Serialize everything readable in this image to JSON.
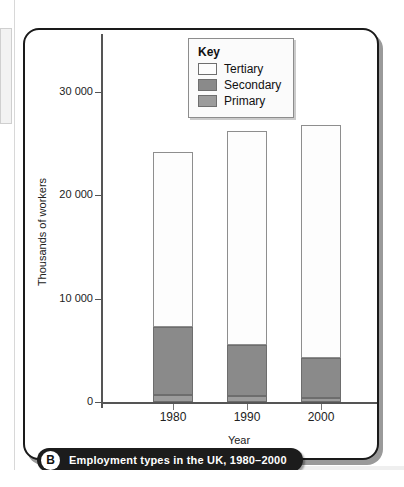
{
  "figure": {
    "badge": "B",
    "caption": "Employment types in the UK, 1980–2000"
  },
  "legend": {
    "title": "Key",
    "entries": [
      {
        "label": "Tertiary",
        "color": "#fdfdfd"
      },
      {
        "label": "Secondary",
        "color": "#8a8a8a"
      },
      {
        "label": "Primary",
        "color": "#9c9c9c"
      }
    ]
  },
  "axes": {
    "y_title": "Thousands of workers",
    "x_title": "Year",
    "y_ticks": [
      "30 000",
      "20 000",
      "10 000",
      "0"
    ],
    "x_ticks": [
      "1980",
      "1990",
      "2000"
    ]
  },
  "chart_data": {
    "type": "bar",
    "stacked": true,
    "title": "Employment types in the UK, 1980–2000",
    "xlabel": "Year",
    "ylabel": "Thousands of workers",
    "categories": [
      "1980",
      "1990",
      "2000"
    ],
    "series": [
      {
        "name": "Primary",
        "color": "#9c9c9c",
        "values": [
          700,
          600,
          400
        ]
      },
      {
        "name": "Secondary",
        "color": "#8a8a8a",
        "values": [
          6600,
          4900,
          3900
        ]
      },
      {
        "name": "Tertiary",
        "color": "#fdfdfd",
        "values": [
          16900,
          20700,
          22500
        ]
      }
    ],
    "totals": [
      24200,
      26200,
      26800
    ],
    "ylim": [
      0,
      32000
    ],
    "ytick_values": [
      0,
      10000,
      20000,
      30000
    ],
    "ytick_labels": [
      "0",
      "10 000",
      "20 000",
      "30 000"
    ],
    "grid": false,
    "legend_position": "top-center"
  }
}
